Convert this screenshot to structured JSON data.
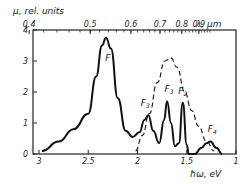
{
  "chart_data": {
    "type": "line",
    "title": "",
    "ylabel": "μ, rel. units",
    "xlabel": "ħω, eV",
    "top_axis_label": "λ, μm",
    "xlim": [
      3,
      1
    ],
    "ylim": [
      0,
      4
    ],
    "x_ticks": [
      "3",
      "2.5",
      "2",
      "1.5",
      "1"
    ],
    "y_ticks": [
      "0",
      "1",
      "2",
      "3",
      "4"
    ],
    "top_ticks": [
      "0.4",
      "0.5",
      "0.6",
      "0.7",
      "0.8",
      "0.9"
    ],
    "grid": false,
    "series": [
      {
        "name": "solid spectrum",
        "style": "solid",
        "x": [
          2.97,
          2.8,
          2.65,
          2.5,
          2.42,
          2.36,
          2.32,
          2.27,
          2.2,
          2.12,
          2.05,
          1.98,
          1.93,
          1.89,
          1.84,
          1.78,
          1.73,
          1.7,
          1.66,
          1.62,
          1.58,
          1.54,
          1.5,
          1.48,
          1.42,
          1.35,
          1.3,
          1.26,
          1.2,
          1.14
        ],
        "y": [
          0.1,
          0.4,
          0.8,
          1.3,
          2.5,
          3.5,
          3.75,
          3.4,
          1.8,
          0.75,
          0.55,
          0.7,
          1.1,
          1.25,
          0.75,
          0.35,
          1.1,
          1.7,
          1.0,
          0.25,
          0.35,
          1.65,
          0.3,
          0.0,
          0.0,
          0.2,
          0.35,
          0.4,
          0.2,
          0.0
        ]
      },
      {
        "name": "dashed envelope",
        "style": "dashed",
        "x": [
          2.02,
          1.95,
          1.88,
          1.8,
          1.72,
          1.66,
          1.6,
          1.52,
          1.45,
          1.38,
          1.3,
          1.22
        ],
        "y": [
          0.1,
          0.6,
          1.3,
          2.3,
          3.0,
          3.1,
          2.8,
          2.0,
          1.4,
          0.9,
          0.4,
          0.1
        ]
      }
    ],
    "annotations": [
      {
        "text": "F",
        "x": 2.3,
        "y": 3.0
      },
      {
        "text": "F3",
        "x": 1.92,
        "y": 1.55
      },
      {
        "text": "F3",
        "x": 1.68,
        "y": 2.0
      },
      {
        "text": "F2",
        "x": 1.54,
        "y": 1.95
      },
      {
        "text": "F4",
        "x": 1.24,
        "y": 0.7
      }
    ]
  }
}
